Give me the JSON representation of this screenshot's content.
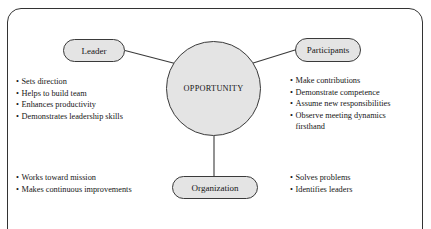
{
  "diagram": {
    "center": {
      "label": "OPPORTUNITY",
      "shape": "circle",
      "fill": "#e4e4e4",
      "stroke": "#3a3a3a"
    },
    "nodes": {
      "leader": {
        "label": "Leader",
        "shape": "stadium"
      },
      "participants": {
        "label": "Participants",
        "shape": "stadium"
      },
      "organization": {
        "label": "Organization",
        "shape": "stadium"
      }
    },
    "bullet_marker": "•",
    "lists": {
      "leader": [
        "Sets direction",
        "Helps to build team",
        "Enhances productivity",
        "Demonstrates leadership skills"
      ],
      "participants": [
        "Make contributions",
        "Demonstrate competence",
        "Assume new responsibilities",
        "Observe meeting dynamics"
      ],
      "participants_last_continuation": "firsthand",
      "organization_left": [
        "Works toward mission",
        "Makes continuous improvements"
      ],
      "organization_right": [
        "Solves problems",
        "Identifies leaders"
      ]
    }
  }
}
